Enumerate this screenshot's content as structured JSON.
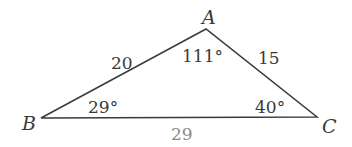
{
  "diagram": {
    "type": "triangle",
    "vertices": {
      "A": {
        "label": "A",
        "x": 206,
        "y": 29
      },
      "B": {
        "label": "B",
        "x": 41,
        "y": 118
      },
      "C": {
        "label": "C",
        "x": 317,
        "y": 117
      }
    },
    "sides": {
      "AB": {
        "label": "20"
      },
      "AC": {
        "label": "15"
      },
      "BC": {
        "label": "29"
      }
    },
    "angles": {
      "A": {
        "label": "111°"
      },
      "B": {
        "label": "29°"
      },
      "C": {
        "label": "40°"
      }
    },
    "colors": {
      "stroke": "#3a3a3a",
      "text": "#3a3a3a",
      "base_label": "#8a8a8a"
    }
  }
}
